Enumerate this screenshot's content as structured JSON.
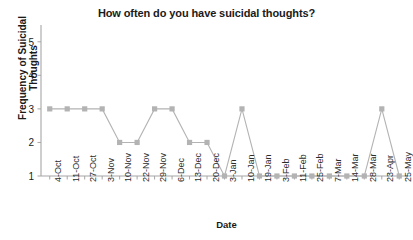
{
  "chart_data": {
    "type": "line",
    "title": "How often do you have suicidal thoughts?",
    "xlabel": "Date",
    "ylabel": "Frequency of Suicidal Thoughts",
    "categories": [
      "4-Oct",
      "11-Oct",
      "27-Oct",
      "3-Nov",
      "10-Nov",
      "22-Nov",
      "29-Nov",
      "6-Dec",
      "13-Dec",
      "20-Dec",
      "3-Jan",
      "10-Jan",
      "19-Jan",
      "3-Feb",
      "11-Feb",
      "25-Feb",
      "7-Mar",
      "14-Mar",
      "28-Mar",
      "23-Apr",
      "25-May"
    ],
    "values": [
      3,
      3,
      3,
      3,
      2,
      2,
      3,
      3,
      2,
      2,
      1,
      3,
      1,
      1,
      1,
      1,
      1,
      1,
      1,
      3,
      1
    ],
    "yticks": [
      1,
      2,
      3,
      4,
      5
    ],
    "ylim": [
      1,
      5.5
    ],
    "grid": false,
    "legend": false,
    "series_color": "#b3b3b3",
    "marker": "square",
    "axis_color": "#a6a6a6",
    "text_color": "#1a1a1a"
  }
}
